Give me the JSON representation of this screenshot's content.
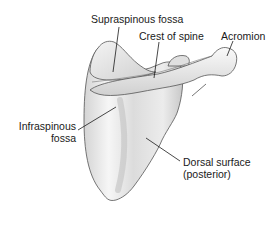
{
  "diagram": {
    "colors": {
      "bone_fill": "#e6e6e6",
      "bone_highlight": "#f7f7f7",
      "bone_shadow": "#b8b8b8",
      "outline": "#555555",
      "leader_line": "#1a1a1a",
      "text": "#1a1a1a",
      "background": "#ffffff"
    },
    "labels": [
      {
        "id": "supraspinous-fossa",
        "text": "Supraspinous fossa"
      },
      {
        "id": "crest-of-spine",
        "text": "Crest of spine"
      },
      {
        "id": "acromion",
        "text": "Acromion"
      },
      {
        "id": "infraspinous-fossa",
        "line1": "Infraspinous",
        "line2": "fossa"
      },
      {
        "id": "dorsal-surface",
        "line1": "Dorsal surface",
        "line2": "(posterior)"
      }
    ]
  }
}
